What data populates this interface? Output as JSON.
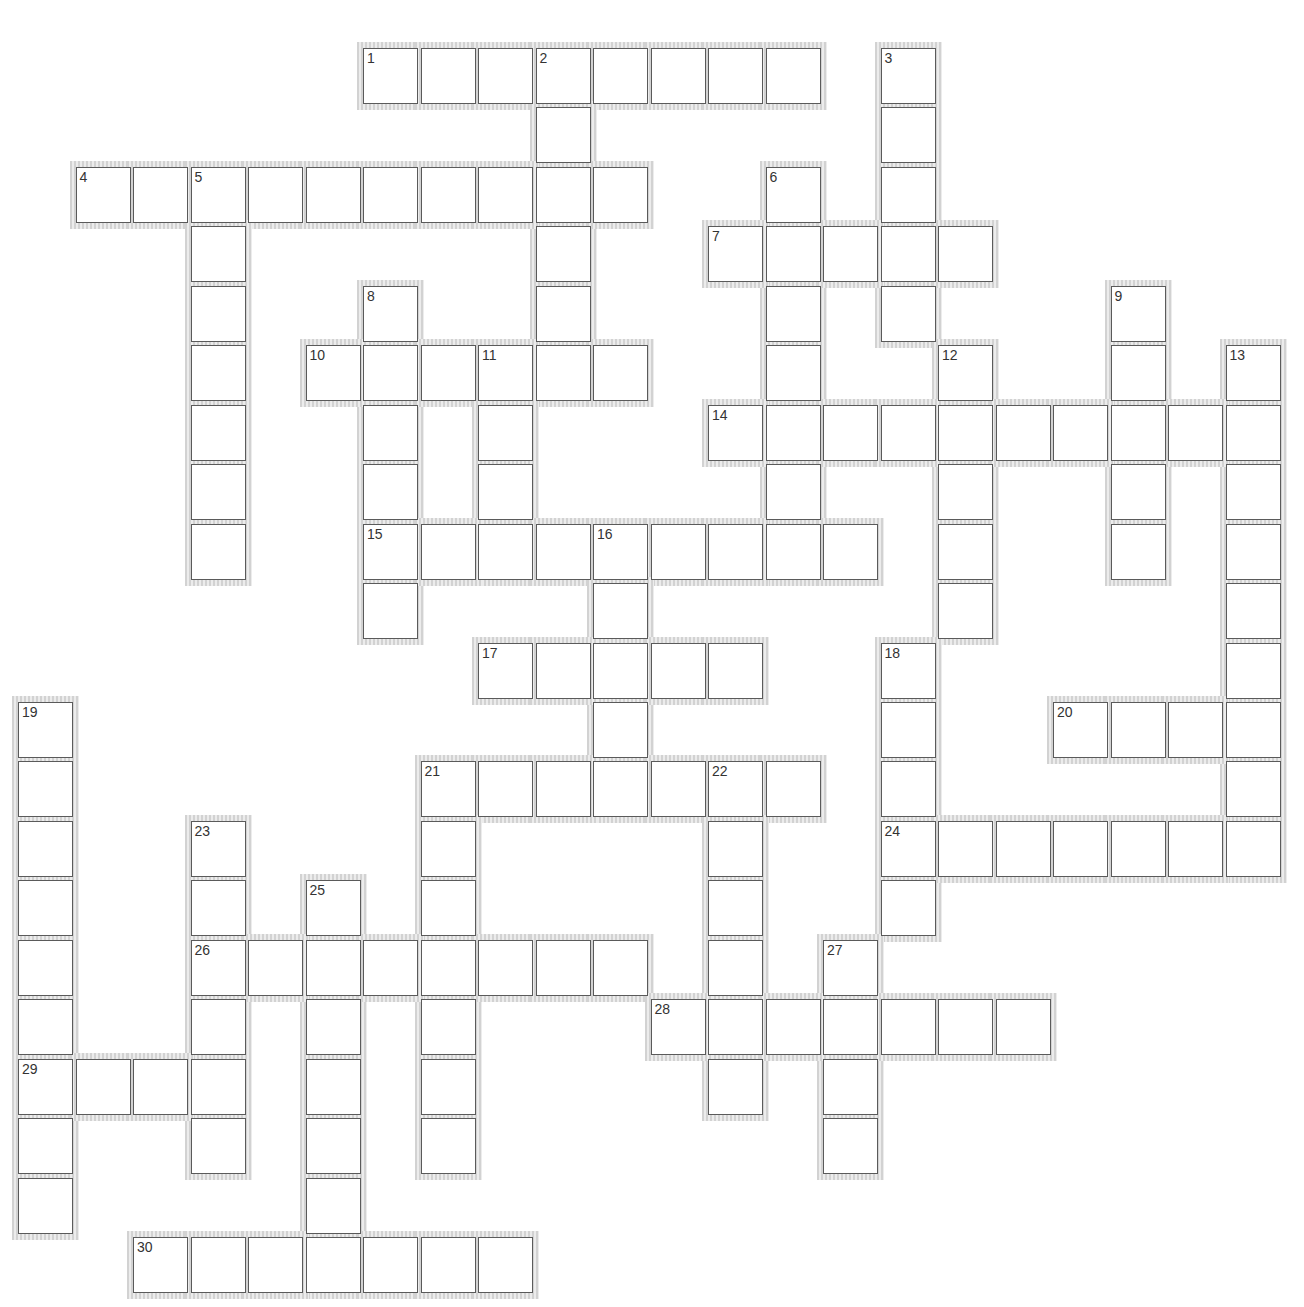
{
  "puzzle": {
    "title": "Crossword",
    "grid": {
      "origin_x": 18,
      "origin_y": 48,
      "pitch_x": 57.5,
      "pitch_y": 59.45,
      "columns": 22,
      "rows": 21
    },
    "colors": {
      "cell_border": "#5a5a5a",
      "cell_fill": "#ffffff",
      "halo": "#dcdcdc",
      "number": "#333333"
    },
    "words": [
      {
        "number": 1,
        "direction": "across",
        "row": 0,
        "col": 6,
        "length": 8
      },
      {
        "number": 2,
        "direction": "down",
        "row": 0,
        "col": 9,
        "length": 6
      },
      {
        "number": 3,
        "direction": "down",
        "row": 0,
        "col": 15,
        "length": 5
      },
      {
        "number": 4,
        "direction": "across",
        "row": 2,
        "col": 1,
        "length": 10
      },
      {
        "number": 5,
        "direction": "down",
        "row": 2,
        "col": 3,
        "length": 7
      },
      {
        "number": 6,
        "direction": "down",
        "row": 2,
        "col": 13,
        "length": 7
      },
      {
        "number": 7,
        "direction": "across",
        "row": 3,
        "col": 12,
        "length": 5
      },
      {
        "number": 8,
        "direction": "down",
        "row": 4,
        "col": 6,
        "length": 6
      },
      {
        "number": 9,
        "direction": "down",
        "row": 4,
        "col": 19,
        "length": 5
      },
      {
        "number": 10,
        "direction": "across",
        "row": 5,
        "col": 5,
        "length": 6
      },
      {
        "number": 11,
        "direction": "down",
        "row": 5,
        "col": 8,
        "length": 4
      },
      {
        "number": 12,
        "direction": "down",
        "row": 5,
        "col": 16,
        "length": 5
      },
      {
        "number": 13,
        "direction": "down",
        "row": 5,
        "col": 21,
        "length": 9
      },
      {
        "number": 14,
        "direction": "across",
        "row": 6,
        "col": 12,
        "length": 10
      },
      {
        "number": 15,
        "direction": "across",
        "row": 8,
        "col": 6,
        "length": 9
      },
      {
        "number": 16,
        "direction": "down",
        "row": 8,
        "col": 10,
        "length": 5
      },
      {
        "number": 17,
        "direction": "across",
        "row": 10,
        "col": 8,
        "length": 5
      },
      {
        "number": 18,
        "direction": "down",
        "row": 10,
        "col": 15,
        "length": 5
      },
      {
        "number": 19,
        "direction": "down",
        "row": 11,
        "col": 0,
        "length": 9
      },
      {
        "number": 20,
        "direction": "across",
        "row": 11,
        "col": 18,
        "length": 4
      },
      {
        "number": 21,
        "direction": "across",
        "row": 12,
        "col": 7,
        "length": 7
      },
      {
        "number": 21,
        "direction": "down",
        "row": 12,
        "col": 7,
        "length": 7
      },
      {
        "number": 22,
        "direction": "down",
        "row": 12,
        "col": 12,
        "length": 6
      },
      {
        "number": 23,
        "direction": "down",
        "row": 13,
        "col": 3,
        "length": 6
      },
      {
        "number": 24,
        "direction": "across",
        "row": 13,
        "col": 15,
        "length": 7
      },
      {
        "number": 25,
        "direction": "down",
        "row": 14,
        "col": 5,
        "length": 7
      },
      {
        "number": 26,
        "direction": "across",
        "row": 15,
        "col": 3,
        "length": 8
      },
      {
        "number": 27,
        "direction": "down",
        "row": 15,
        "col": 14,
        "length": 4
      },
      {
        "number": 28,
        "direction": "across",
        "row": 16,
        "col": 11,
        "length": 7
      },
      {
        "number": 29,
        "direction": "across",
        "row": 17,
        "col": 0,
        "length": 4
      },
      {
        "number": 30,
        "direction": "across",
        "row": 20,
        "col": 2,
        "length": 7
      }
    ]
  }
}
